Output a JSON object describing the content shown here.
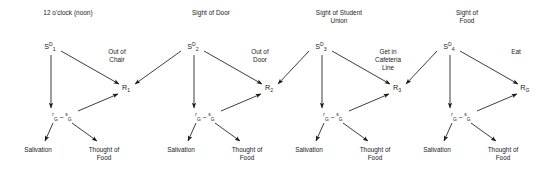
{
  "diagram": {
    "width": 542,
    "height": 170,
    "line_color": "#1a1a1a",
    "background_color": "#ffffff"
  },
  "units": [
    {
      "header": "12 o'clock (noon)",
      "sd_symbol": "S",
      "sd_super": "D",
      "sd_sub": "1",
      "goal_pre": "r",
      "goal_sub_1": "G",
      "goal_dash": "–",
      "goal_mid": "s",
      "goal_sub_2": "G",
      "response_symbol": "R",
      "response_sub": "1",
      "response_label": "Out of\nChair",
      "outcome_left": "Salivation",
      "outcome_right": "Thought of\nFood"
    },
    {
      "header": "Sight of Door",
      "sd_symbol": "S",
      "sd_super": "D",
      "sd_sub": "2",
      "goal_pre": "r",
      "goal_sub_1": "G",
      "goal_dash": "–",
      "goal_mid": "s",
      "goal_sub_2": "G",
      "response_symbol": "R",
      "response_sub": "2",
      "response_label": "Out of\nDoor",
      "outcome_left": "Salivation",
      "outcome_right": "Thought of\nFood"
    },
    {
      "header": "Sight of Student\nUnion",
      "sd_symbol": "S",
      "sd_super": "D",
      "sd_sub": "3",
      "goal_pre": "r",
      "goal_sub_1": "G",
      "goal_dash": "–",
      "goal_mid": "s",
      "goal_sub_2": "G",
      "response_symbol": "R",
      "response_sub": "3",
      "response_label": "Get in\nCafeteria\nLine",
      "outcome_left": "Salivation",
      "outcome_right": "Thought of\nFood"
    },
    {
      "header": "Sight of\nFood",
      "sd_symbol": "S",
      "sd_super": "D",
      "sd_sub": "4",
      "goal_pre": "r",
      "goal_sub_1": "G",
      "goal_dash": "–",
      "goal_mid": "s",
      "goal_sub_2": "G",
      "response_symbol": "R",
      "response_sub": "G",
      "response_label": "Eat",
      "outcome_left": "Salivation",
      "outcome_right": "Thought of\nFood"
    }
  ],
  "geometry": {
    "unit_origins": [
      0,
      143,
      271,
      399
    ],
    "sd_x": 50,
    "sd_y": 47,
    "goal_x": 62,
    "goal_y": 117,
    "resp_x": 126,
    "resp_y": 88,
    "header_x": 68,
    "header_y": 14,
    "resp_lbl_x": 117,
    "resp_lbl_y": 52,
    "out_left_x": 38,
    "out_left_y": 146,
    "out_right_x": 104,
    "out_right_y": 146
  }
}
